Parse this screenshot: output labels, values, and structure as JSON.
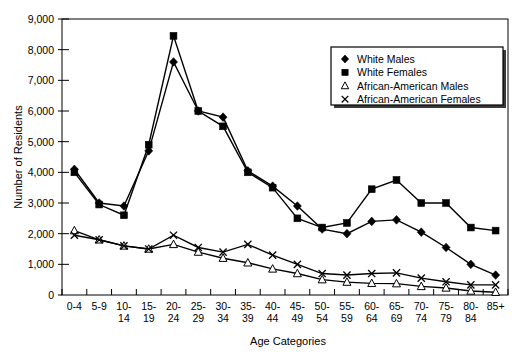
{
  "chart_data": {
    "type": "line",
    "title": "",
    "xlabel": "Age Categories",
    "ylabel": "Number of Residents",
    "ylim": [
      0,
      9000
    ],
    "ytick_step": 1000,
    "grid": false,
    "legend_position": "top-right",
    "categories": [
      "0-4",
      "5-9",
      "10-14",
      "15-19",
      "20-24",
      "25-29",
      "30-34",
      "35-39",
      "40-44",
      "45-49",
      "50-54",
      "55-59",
      "60-64",
      "65-69",
      "70-74",
      "75-79",
      "80-84",
      "85+"
    ],
    "ytick_labels": [
      "0",
      "1,000",
      "2,000",
      "3,000",
      "4,000",
      "5,000",
      "6,000",
      "7,000",
      "8,000",
      "9,000"
    ],
    "series": [
      {
        "name": "White Males",
        "marker": "filled-diamond",
        "values": [
          4100,
          3000,
          2900,
          4700,
          7600,
          6000,
          5800,
          4050,
          3550,
          2900,
          2150,
          2000,
          2400,
          2450,
          2050,
          1550,
          1000,
          650
        ]
      },
      {
        "name": "White Females",
        "marker": "filled-square",
        "values": [
          4000,
          2950,
          2600,
          4900,
          8450,
          6000,
          5500,
          4000,
          3500,
          2500,
          2200,
          2350,
          3450,
          3750,
          3000,
          3000,
          2200,
          2100
        ]
      },
      {
        "name": "African-American Males",
        "marker": "open-triangle",
        "values": [
          2100,
          1800,
          1600,
          1500,
          1650,
          1400,
          1200,
          1050,
          850,
          700,
          500,
          420,
          380,
          370,
          280,
          230,
          130,
          90
        ]
      },
      {
        "name": "African-American Females",
        "marker": "cross-x",
        "values": [
          1950,
          1800,
          1600,
          1500,
          1950,
          1550,
          1400,
          1650,
          1300,
          1000,
          700,
          650,
          700,
          720,
          550,
          430,
          330,
          330
        ]
      }
    ]
  },
  "legend": {
    "entries": [
      {
        "label": "White Males",
        "marker": "filled-diamond"
      },
      {
        "label": "White Females",
        "marker": "filled-square"
      },
      {
        "label": "African-American Males",
        "marker": "open-triangle"
      },
      {
        "label": "African-American Females",
        "marker": "cross-x"
      }
    ]
  },
  "axes": {
    "x_title": "Age Categories",
    "y_title": "Number of Residents"
  }
}
